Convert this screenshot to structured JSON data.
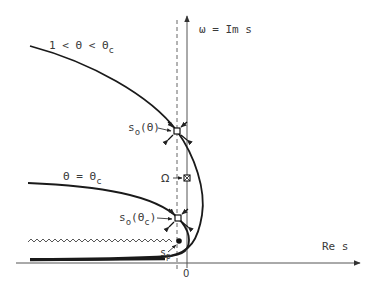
{
  "diagram": {
    "axes": {
      "vertical_label": "ω = Im s",
      "horizontal_label": "Re s",
      "origin_label": "0"
    },
    "curves": [
      {
        "id": "curve-upper",
        "label": "1 < Θ < Θ",
        "label_sub": "c"
      },
      {
        "id": "curve-critical",
        "label": "Θ = Θ",
        "label_sub": "c"
      }
    ],
    "points": {
      "saddle_upper": {
        "label": "s",
        "label_sub": "o",
        "label_arg": "(Θ)"
      },
      "saddle_critical": {
        "label": "s",
        "label_sub": "o",
        "label_arg": "(Θ",
        "label_arg_sub": "c",
        "label_close": ")"
      },
      "omega": {
        "label": "Ω"
      },
      "pole": {
        "label": "s",
        "label_sub": "p"
      }
    },
    "colors": {
      "ink": "#1a1a1a",
      "axis": "#555555",
      "text": "#3a3a3a",
      "background": "#ffffff"
    }
  }
}
